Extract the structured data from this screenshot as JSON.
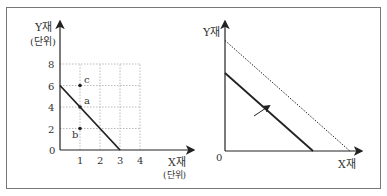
{
  "chart_data": [
    {
      "type": "line",
      "title": "",
      "xlabel": "X재",
      "xlabel_unit": "(단위)",
      "ylabel": "Y재",
      "ylabel_unit": "(단위)",
      "origin_label": "0",
      "xlim": [
        0,
        4
      ],
      "ylim": [
        0,
        8
      ],
      "xticks": [
        "1",
        "2",
        "3",
        "4"
      ],
      "yticks": [
        "2",
        "4",
        "6",
        "8"
      ],
      "grid": true,
      "series": [
        {
          "name": "budget-line",
          "style": "solid",
          "points": [
            [
              0,
              6
            ],
            [
              3,
              0
            ]
          ]
        }
      ],
      "points": [
        {
          "label": "c",
          "x": 1,
          "y": 6
        },
        {
          "label": "a",
          "x": 1,
          "y": 4
        },
        {
          "label": "b",
          "x": 1,
          "y": 2
        }
      ]
    },
    {
      "type": "line",
      "title": "",
      "xlabel": "X재",
      "ylabel": "Y재",
      "origin_label": "0",
      "grid": false,
      "series": [
        {
          "name": "original-budget-line",
          "style": "solid",
          "points": [
            [
              0,
              0.6
            ],
            [
              0.55,
              0
            ]
          ]
        },
        {
          "name": "shifted-budget-line",
          "style": "dotted",
          "points": [
            [
              0,
              0.85
            ],
            [
              0.78,
              0
            ]
          ]
        }
      ],
      "annotations": [
        {
          "type": "arrow",
          "meaning": "outward shift of budget line"
        }
      ]
    }
  ]
}
